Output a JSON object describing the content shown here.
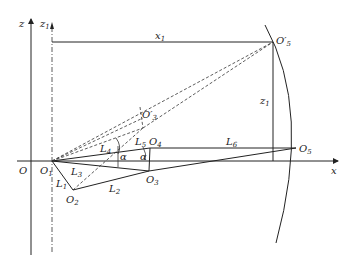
{
  "diagram": {
    "axes": {
      "z": {
        "label": "z"
      },
      "z1": {
        "label": "z",
        "sub": "1"
      },
      "x": {
        "label": "x"
      },
      "origin": {
        "label": "O"
      }
    },
    "points": {
      "O1": {
        "label": "O",
        "sub": "1"
      },
      "O2": {
        "label": "O",
        "sub": "2"
      },
      "O3": {
        "label": "O",
        "sub": "3"
      },
      "O4": {
        "label": "O",
        "sub": "4"
      },
      "O5": {
        "label": "O",
        "sub": "5"
      },
      "O5p": {
        "label": "O′",
        "sub": "5"
      },
      "O3p": {
        "label": "O′",
        "sub": "3"
      }
    },
    "links": {
      "L1": {
        "label": "L",
        "sub": "1"
      },
      "L2": {
        "label": "L",
        "sub": "2"
      },
      "L3": {
        "label": "L",
        "sub": "3"
      },
      "L4": {
        "label": "L",
        "sub": "4"
      },
      "L5": {
        "label": "L",
        "sub": "5"
      },
      "L6": {
        "label": "L",
        "sub": "6"
      }
    },
    "dimensions": {
      "x1": {
        "label": "x",
        "sub": "1"
      },
      "z1": {
        "label": "z",
        "sub": "1"
      }
    },
    "angles": [
      {
        "label": "α"
      },
      {
        "label": "α"
      }
    ]
  }
}
